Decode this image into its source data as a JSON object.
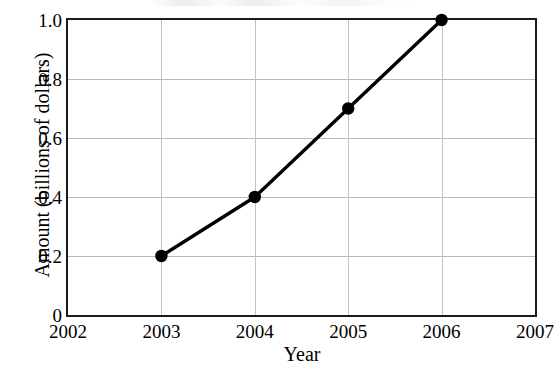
{
  "chart_data": {
    "type": "line",
    "title": "",
    "xlabel": "Year",
    "ylabel": "Amount (billions of dollars)",
    "x": [
      2003,
      2004,
      2005,
      2006
    ],
    "values": [
      0.2,
      0.4,
      0.7,
      1.0
    ],
    "series": [
      {
        "name": "Amount",
        "x": [
          2003,
          2004,
          2005,
          2006
        ],
        "values": [
          0.2,
          0.4,
          0.7,
          1.0
        ],
        "color": "#000000",
        "marker": "filled-circle",
        "line_style": "solid"
      }
    ],
    "xlim": [
      2002,
      2007
    ],
    "ylim": [
      0,
      1.0
    ],
    "xticks": [
      2002,
      2003,
      2004,
      2005,
      2006,
      2007
    ],
    "xtick_labels": [
      "2002",
      "2003",
      "2004",
      "2005",
      "2006",
      "2007"
    ],
    "yticks": [
      0,
      0.2,
      0.4,
      0.6,
      0.8,
      1.0
    ],
    "ytick_labels": [
      "0",
      "0.2",
      "0.4",
      "0.6",
      "0.8",
      "1.0"
    ],
    "grid": true,
    "grid_axes": "both",
    "legend": false,
    "legend_position": "none",
    "annotations": []
  },
  "style": {
    "line_color": "#000000",
    "marker_color": "#000000",
    "frame_color": "#1a1a1a",
    "gridline_color": "#b9b9b9",
    "background": "#ffffff"
  }
}
